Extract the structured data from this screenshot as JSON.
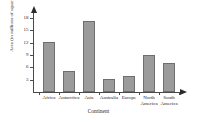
{
  "chart_data": {
    "type": "bar",
    "title": "",
    "xlabel": "Continent",
    "ylabel": "Area (in millions of square miles)",
    "categories": [
      "Africa",
      "Antarctica",
      "Asia",
      "Australia",
      "Europe",
      "North America",
      "South America"
    ],
    "category_lines": [
      [
        "Africa"
      ],
      [
        "Antarctica"
      ],
      [
        "Asia"
      ],
      [
        "Australia"
      ],
      [
        "Europe"
      ],
      [
        "North",
        "America"
      ],
      [
        "South",
        "America"
      ]
    ],
    "values": [
      12.1,
      5.1,
      17.4,
      3.1,
      3.8,
      9.0,
      7.0
    ],
    "ylim": [
      0,
      19.5
    ],
    "yticks": [
      3,
      6,
      9,
      12,
      15,
      18
    ],
    "ytick_labels": [
      "3",
      "6",
      "9",
      "12",
      "15",
      "18"
    ],
    "grid": false,
    "legend": null,
    "bar_color": "#9b9b9b",
    "bar_border_color": "#6f6f6f",
    "axis_color": "#4a4a4a"
  }
}
